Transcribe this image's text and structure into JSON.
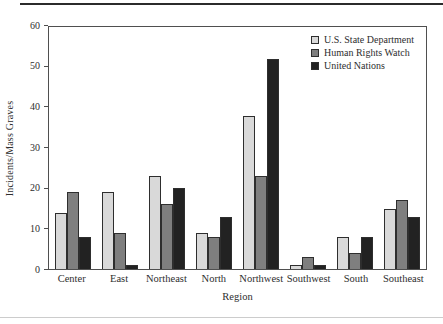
{
  "figure": {
    "background": "#ffffff",
    "top_rule_color": "#2b2b2b",
    "bottom_rule_color": "#cccccc",
    "axis_color": "#4f4f4f",
    "text_color": "#2e2e2e"
  },
  "chart_data": {
    "type": "bar",
    "title": "",
    "xlabel": "Region",
    "ylabel": "Incidents/Mass Graves",
    "ylim": [
      0,
      60
    ],
    "yticks": [
      0,
      10,
      20,
      30,
      40,
      50,
      60
    ],
    "grid": false,
    "legend_position": "top-right-inside",
    "bar_border_color": "#2e2e2e",
    "categories": [
      "Center",
      "East",
      "Northeast",
      "North",
      "Northwest",
      "Southwest",
      "South",
      "Southeast"
    ],
    "series": [
      {
        "name": "U.S. State Department",
        "color": "#d9d9d9",
        "values": [
          14,
          19,
          23,
          9,
          38,
          1,
          8,
          15
        ]
      },
      {
        "name": "Human Rights Watch",
        "color": "#7f7f7f",
        "values": [
          19,
          9,
          16,
          8,
          23,
          3,
          4,
          17
        ]
      },
      {
        "name": "United Nations",
        "color": "#222222",
        "values": [
          8,
          1,
          20,
          13,
          52,
          1,
          8,
          13
        ]
      }
    ]
  }
}
